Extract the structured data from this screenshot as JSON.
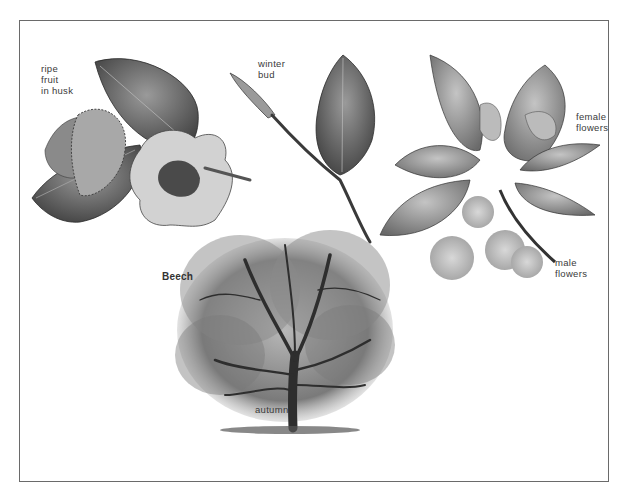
{
  "plate": {
    "title": "Beech",
    "background": "#ffffff",
    "border_color": "#6a6a6a",
    "ink_color": "#3a3a3a"
  },
  "labels": {
    "ripe_fruit": "ripe\nfruit\nin husk",
    "winter_bud": "winter\nbud",
    "female_flowers": "female\nflowers",
    "male_flowers": "male\nflowers",
    "autumn": "autumn"
  },
  "illustrations": [
    {
      "name": "ripe-fruit-in-husk",
      "description": "beech leaves with opened spiky husk and nut"
    },
    {
      "name": "winter-bud",
      "description": "twig with pointed winter bud and single leaf"
    },
    {
      "name": "flowers",
      "description": "leafy shoot with female flowers and hanging male flower clusters"
    },
    {
      "name": "tree-autumn",
      "description": "full beech tree silhouette in autumn"
    }
  ]
}
